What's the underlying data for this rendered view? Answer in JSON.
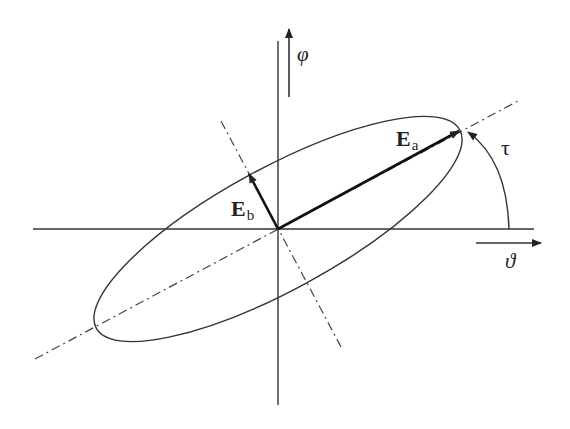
{
  "diagram": {
    "colors": {
      "line": "#333333",
      "background": "#ffffff"
    },
    "labels": {
      "phi_axis": "φ",
      "theta_axis": "ϑ",
      "tilt_angle": "τ",
      "major_vector": {
        "main": "E",
        "sub": "a"
      },
      "minor_vector": {
        "main": "E",
        "sub": "b"
      }
    },
    "geometry": {
      "center": [
        278,
        229
      ],
      "semi_major": 207,
      "semi_minor": 61,
      "tilt_deg": 28.6
    }
  }
}
